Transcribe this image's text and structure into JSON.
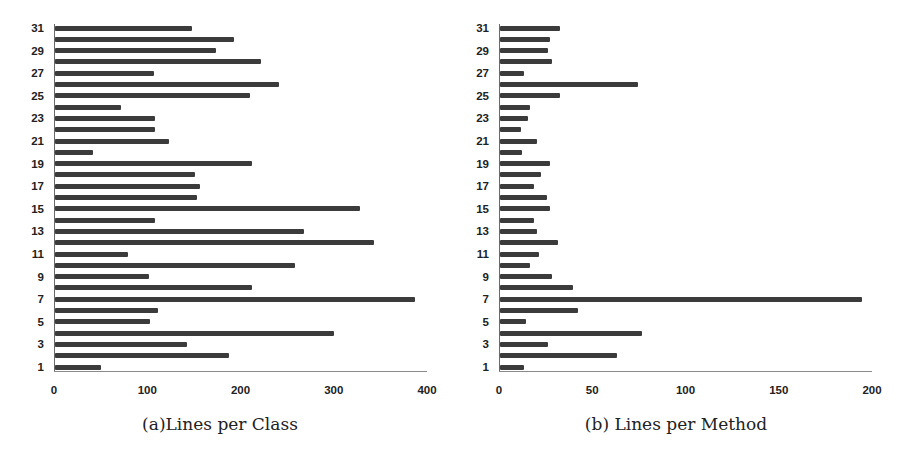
{
  "chart_data": [
    {
      "type": "bar",
      "orientation": "horizontal",
      "title": "(a)Lines per Class",
      "xlabel": "",
      "ylabel": "",
      "xlim": [
        0,
        400
      ],
      "xticks": [
        "0",
        "100",
        "200",
        "300",
        "400"
      ],
      "yticks": [
        "1",
        "3",
        "5",
        "7",
        "9",
        "11",
        "13",
        "15",
        "17",
        "19",
        "21",
        "23",
        "25",
        "27",
        "29",
        "31"
      ],
      "grid": false,
      "categories": [
        1,
        2,
        3,
        4,
        5,
        6,
        7,
        8,
        9,
        10,
        11,
        12,
        13,
        14,
        15,
        16,
        17,
        18,
        19,
        20,
        21,
        22,
        23,
        24,
        25,
        26,
        27,
        28,
        29,
        30,
        31
      ],
      "values": [
        49,
        187,
        142,
        299,
        102,
        110,
        386,
        211,
        101,
        257,
        78,
        342,
        267,
        107,
        327,
        152,
        155,
        150,
        211,
        41,
        122,
        107,
        107,
        71,
        209,
        240,
        106,
        221,
        173,
        192,
        147
      ]
    },
    {
      "type": "bar",
      "orientation": "horizontal",
      "title": "(b) Lines per Method",
      "xlabel": "",
      "ylabel": "",
      "xlim": [
        0,
        200
      ],
      "xticks": [
        "0",
        "50",
        "100",
        "150",
        "200"
      ],
      "yticks": [
        "1",
        "3",
        "5",
        "7",
        "9",
        "11",
        "13",
        "15",
        "17",
        "19",
        "21",
        "23",
        "25",
        "27",
        "29",
        "31"
      ],
      "grid": false,
      "categories": [
        1,
        2,
        3,
        4,
        5,
        6,
        7,
        8,
        9,
        10,
        11,
        12,
        13,
        14,
        15,
        16,
        17,
        18,
        19,
        20,
        21,
        22,
        23,
        24,
        25,
        26,
        27,
        28,
        29,
        30,
        31
      ],
      "values": [
        13,
        63,
        26,
        76,
        14,
        42,
        194,
        39,
        28,
        16,
        21,
        31,
        20,
        18,
        27,
        25,
        18,
        22,
        27,
        12,
        20,
        11,
        15,
        16,
        32,
        74,
        13,
        28,
        26,
        27,
        32
      ]
    }
  ],
  "captions": {
    "a": "(a)Lines per Class",
    "b": "(b) Lines per Method"
  },
  "colors": {
    "bar": "#3b3b3b",
    "axis": "#6a6a6a",
    "text": "#222222"
  }
}
